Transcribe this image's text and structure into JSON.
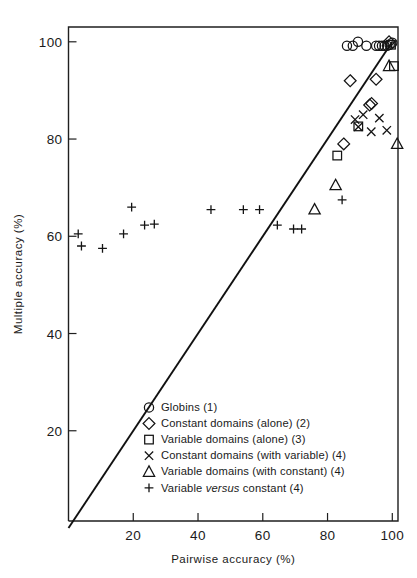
{
  "figure": {
    "background_color": "#ffffff",
    "ink_color": "#1a1a1a"
  },
  "axes": {
    "x": {
      "label": "Pairwise accuracy (%)",
      "ticks": [
        "20",
        "40",
        "60",
        "80",
        "100"
      ],
      "tick_values": [
        20,
        40,
        60,
        80,
        100
      ],
      "range": [
        0,
        104
      ]
    },
    "y": {
      "label": "Multiple accuracy (%)",
      "ticks": [
        "20",
        "40",
        "60",
        "80",
        "100"
      ],
      "tick_values": [
        20,
        40,
        60,
        80,
        100
      ],
      "range": [
        0,
        104
      ]
    }
  },
  "legend": {
    "items": [
      {
        "marker": "circle",
        "marker_glyph": "circle-marker",
        "label": "Globins (1)"
      },
      {
        "marker": "diamond",
        "marker_glyph": "diamond-marker",
        "label": "Constant domains (alone) (2)"
      },
      {
        "marker": "square",
        "marker_glyph": "square-marker",
        "label": "Variable domains (alone) (3)"
      },
      {
        "marker": "cross",
        "marker_glyph": "cross-marker",
        "label": "Constant domains (with variable) (4)"
      },
      {
        "marker": "triangle",
        "marker_glyph": "triangle-marker",
        "label": "Variable domains (with constant) (4)"
      },
      {
        "marker": "plus",
        "marker_glyph": "plus-marker",
        "label_pre": "Variable ",
        "label_italic": "versus",
        "label_post": " constant (4)"
      }
    ]
  },
  "chart_data": {
    "type": "scatter",
    "title": "",
    "xlabel": "Pairwise accuracy (%)",
    "ylabel": "Multiple accuracy (%)",
    "xlim": [
      0,
      104
    ],
    "ylim": [
      0,
      104
    ],
    "grid": false,
    "legend_position": "inside-bottom-center",
    "reference_line": {
      "name": "identity line (y = x)",
      "x": [
        0,
        100
      ],
      "y": [
        0,
        100
      ]
    },
    "series": [
      {
        "name": "Globins (1)",
        "marker": "circle",
        "points": [
          [
            86.0,
            99.2
          ],
          [
            87.8,
            99.2
          ],
          [
            89.4,
            100.0
          ],
          [
            92.0,
            99.2
          ],
          [
            95.0,
            99.2
          ],
          [
            95.9,
            99.2
          ],
          [
            96.8,
            99.2
          ],
          [
            97.6,
            99.2
          ],
          [
            98.4,
            99.2
          ],
          [
            99.2,
            99.4
          ],
          [
            100.0,
            99.8
          ]
        ]
      },
      {
        "name": "Constant domains (alone) (2)",
        "marker": "diamond",
        "points": [
          [
            87.0,
            92.0
          ],
          [
            95.0,
            92.3
          ],
          [
            93.0,
            87.0
          ],
          [
            93.6,
            87.3
          ],
          [
            85.0,
            79.0
          ],
          [
            99.0,
            100.0
          ]
        ]
      },
      {
        "name": "Variable domains (alone) (3)",
        "marker": "square",
        "points": [
          [
            83.0,
            76.6
          ],
          [
            89.5,
            82.6
          ],
          [
            99.6,
            99.4
          ],
          [
            100.5,
            95.0
          ]
        ]
      },
      {
        "name": "Constant domains (with variable) (4)",
        "marker": "cross",
        "points": [
          [
            88.5,
            84.0
          ],
          [
            91.0,
            85.0
          ],
          [
            89.5,
            82.5
          ],
          [
            93.5,
            81.5
          ],
          [
            96.0,
            84.3
          ],
          [
            98.3,
            81.8
          ]
        ]
      },
      {
        "name": "Variable domains (with constant) (4)",
        "marker": "triangle",
        "points": [
          [
            76.0,
            65.5
          ],
          [
            82.5,
            70.5
          ],
          [
            99.0,
            95.0
          ],
          [
            101.5,
            79.0
          ]
        ]
      },
      {
        "name": "Variable versus constant (4)",
        "marker": "plus",
        "points": [
          [
            3.0,
            60.5
          ],
          [
            4.0,
            58.0
          ],
          [
            10.5,
            57.5
          ],
          [
            17.0,
            60.5
          ],
          [
            19.5,
            66.0
          ],
          [
            23.5,
            62.3
          ],
          [
            26.5,
            62.5
          ],
          [
            44.0,
            65.5
          ],
          [
            54.0,
            65.5
          ],
          [
            59.0,
            65.5
          ],
          [
            64.5,
            62.3
          ],
          [
            69.5,
            61.5
          ],
          [
            72.0,
            61.5
          ],
          [
            84.5,
            67.5
          ]
        ]
      }
    ]
  }
}
